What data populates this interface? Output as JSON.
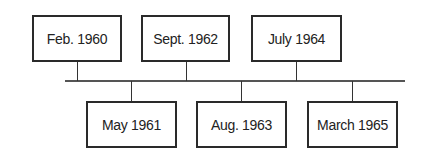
{
  "timeline": {
    "top_events": [
      {
        "label": "Feb. 1960",
        "x": 32,
        "w": 90,
        "cx": 77
      },
      {
        "label": "Sept. 1962",
        "x": 141,
        "w": 89,
        "cx": 186
      },
      {
        "label": "July 1964",
        "x": 251,
        "w": 91,
        "cx": 296
      }
    ],
    "bottom_events": [
      {
        "label": "May 1961",
        "x": 86,
        "w": 91,
        "cx": 131
      },
      {
        "label": "Aug. 1963",
        "x": 196,
        "w": 91,
        "cx": 241
      },
      {
        "label": "March 1965",
        "x": 307,
        "w": 91,
        "cx": 352
      }
    ],
    "axis": {
      "x1": 65,
      "x2": 405,
      "y": 80
    }
  }
}
